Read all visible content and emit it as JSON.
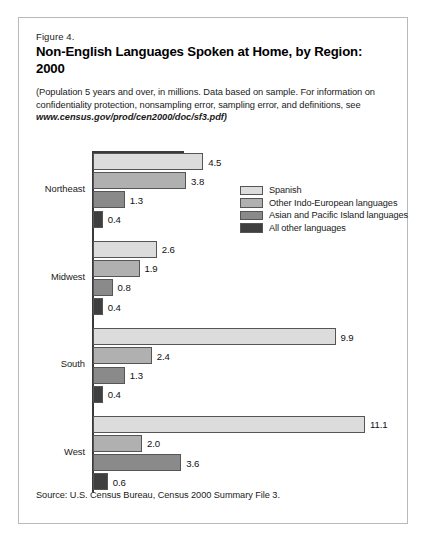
{
  "figure": {
    "number_label": "Figure 4.",
    "title": "Non-English Languages Spoken at Home, by Region: 2000",
    "subtitle_text": "(Population 5 years and over, in millions.  Data based on sample.  For information on confidentiality protection, nonsampling error, sampling error, and definitions, see ",
    "subtitle_url": "www.census.gov/prod/cen2000/doc/sf3.pdf)",
    "source": "Source: U.S. Census Bureau, Census 2000 Summary File 3."
  },
  "chart_data": {
    "type": "bar",
    "orientation": "horizontal",
    "title": "Non-English Languages Spoken at Home, by Region: 2000",
    "xlabel": "",
    "ylabel": "",
    "unit": "millions",
    "xlim": [
      0,
      11.1
    ],
    "grid": false,
    "legend_position": "top-right-inside",
    "categories": [
      "Northeast",
      "Midwest",
      "South",
      "West"
    ],
    "series": [
      {
        "name": "Spanish",
        "color": "#dcdcdc",
        "values": [
          4.5,
          2.6,
          9.9,
          11.1
        ],
        "labels": [
          "4.5",
          "2.6",
          "9.9",
          "11.1"
        ]
      },
      {
        "name": "Other Indo-European languages",
        "color": "#b0b0b0",
        "values": [
          3.8,
          1.9,
          2.4,
          2.0
        ],
        "labels": [
          "3.8",
          "1.9",
          "2.4",
          "2.0"
        ]
      },
      {
        "name": "Asian and Pacific Island languages",
        "color": "#8a8a8a",
        "values": [
          1.3,
          0.8,
          1.3,
          3.6
        ],
        "labels": [
          "1.3",
          "0.8",
          "1.3",
          "3.6"
        ]
      },
      {
        "name": "All other languages",
        "color": "#3f3f3f",
        "values": [
          0.4,
          0.4,
          0.4,
          0.6
        ],
        "labels": [
          "0.4",
          "0.4",
          "0.4",
          "0.6"
        ]
      }
    ]
  }
}
